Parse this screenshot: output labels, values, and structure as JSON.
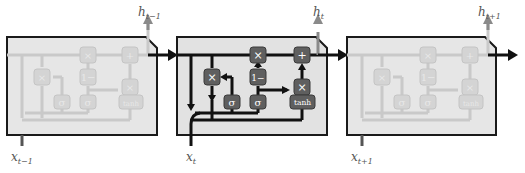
{
  "diagram": {
    "type": "GRU recurrent unit unrolled over time",
    "colors": {
      "cell_fill": "#e4e4e4",
      "cell_border": "#1a1a1a",
      "active_line": "#111111",
      "faded_line": "#c9c9c9",
      "faded_op_fill": "#d8d8d8",
      "op_fill": "#5f5f5f",
      "op_border": "#3a3a3a",
      "output_arrow": "#8a8a8a",
      "label": "#555555"
    },
    "cells": [
      {
        "id": "cell-t-minus-1",
        "active": false,
        "output_label": "h",
        "output_sub": "t−1",
        "input_label": "x",
        "input_sub": "t−1"
      },
      {
        "id": "cell-t",
        "active": true,
        "output_label": "h",
        "output_sub": "t",
        "input_label": "x",
        "input_sub": "t"
      },
      {
        "id": "cell-t-plus-1",
        "active": false,
        "output_label": "h",
        "output_sub": "t+1",
        "input_label": "x",
        "input_sub": "t+1"
      }
    ],
    "operators": {
      "multiply": "×",
      "add": "+",
      "one_minus": "1−",
      "sigma": "σ",
      "tanh": "tanh"
    }
  }
}
